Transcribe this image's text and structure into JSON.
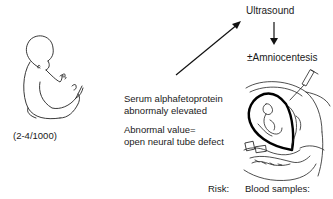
{
  "diagram": {
    "nodes": {
      "ultrasound": "Ultrasound",
      "amniocentesis": "±Amniocentesis",
      "serum_line1": "Serum alphafetoprotein",
      "serum_line2": "abnormaly elevated",
      "abnormal_line1": "Abnormal value=",
      "abnormal_line2": "open neural tube defect",
      "incidence": "(2-4/1000)",
      "risk_label": "Risk:",
      "blood_samples_label": "Blood samples:"
    },
    "illustrations": {
      "fetus": "fetus-drawing",
      "amniocentesis_procedure": "uterus-needle-drawing"
    },
    "colors": {
      "line": "#111111",
      "background": "#ffffff"
    }
  }
}
